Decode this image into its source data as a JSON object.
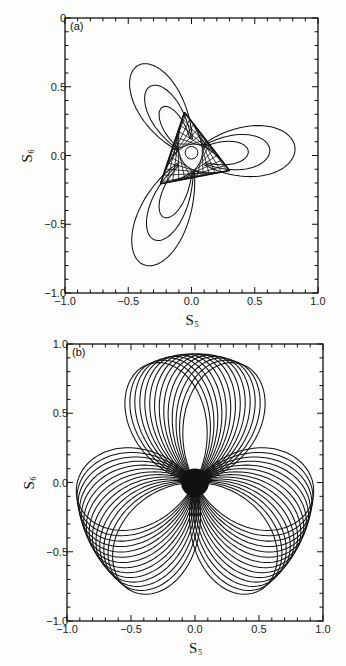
{
  "figure": {
    "background": "#fdfdfb",
    "line_color": "#111111"
  },
  "chart_data": [
    {
      "type": "line",
      "panel_label": "(a)",
      "title": "",
      "xlabel": "S5",
      "xlabel_main": "S",
      "xlabel_sub": "5",
      "ylabel": "S6",
      "ylabel_main": "S",
      "ylabel_sub": "6",
      "xlim": [
        -1.0,
        1.0
      ],
      "ylim": [
        -1.0,
        1.0
      ],
      "x_ticks": [
        "-1.0",
        "-0.5",
        "0.0",
        "0.5",
        "1.0"
      ],
      "y_ticks": [
        "-1.0",
        "-0.5",
        "0.0",
        "0.5",
        "0"
      ],
      "y_tick_values": [
        -1.0,
        -0.5,
        0.0,
        0.5,
        1.0
      ],
      "x_tick_values": [
        -1.0,
        -0.5,
        0.0,
        0.5,
        1.0
      ],
      "minor_tick_step": 0.1,
      "grid": false,
      "legend": null,
      "description": "Phase-space trajectory with three-fold symmetry: dense triangular web near origin with a small hole, plus three nested loop lobes extending to approx (-0.4,0.7), (0.8,0.0), (-0.45,-0.8)",
      "lobes": [
        {
          "direction_deg": 118,
          "loop_extents": [
            0.78,
            0.6,
            0.42
          ]
        },
        {
          "direction_deg": -2,
          "loop_extents": [
            0.82,
            0.62,
            0.45
          ]
        },
        {
          "direction_deg": 238,
          "loop_extents": [
            0.88,
            0.68,
            0.5
          ]
        }
      ],
      "web": {
        "radius": 0.32,
        "hole_radius": 0.05,
        "strands": 34
      },
      "frame_px": {
        "left": 65,
        "top": 18,
        "right": 318,
        "bottom": 293
      }
    },
    {
      "type": "line",
      "panel_label": "(b)",
      "title": "",
      "xlabel": "S5",
      "xlabel_main": "S",
      "xlabel_sub": "5",
      "ylabel": "S6",
      "ylabel_main": "S",
      "ylabel_sub": "6",
      "xlim": [
        -1.0,
        1.0
      ],
      "ylim": [
        -1.0,
        1.0
      ],
      "x_ticks": [
        "-1.0",
        "-0.5",
        "0.0",
        "0.5",
        "1.0"
      ],
      "y_ticks": [
        "-1.0",
        "-0.5",
        "0.0",
        "0.5",
        "1.0"
      ],
      "y_tick_values": [
        -1.0,
        -0.5,
        0.0,
        0.5,
        1.0
      ],
      "x_tick_values": [
        -1.0,
        -0.5,
        0.0,
        0.5,
        1.0
      ],
      "minor_tick_step": 0.1,
      "grid": false,
      "legend": null,
      "description": "Three-lobed rosette (trefoil) of petal loops passing through origin; each lobe composed of ~14 rotated elongated loops reaching radius ~0.93; dense black center",
      "lobes": [
        {
          "direction_deg": 90,
          "petals": 14,
          "spread_deg": 50,
          "length": 0.93
        },
        {
          "direction_deg": 210,
          "petals": 14,
          "spread_deg": 50,
          "length": 0.93
        },
        {
          "direction_deg": 330,
          "petals": 14,
          "spread_deg": 50,
          "length": 0.93
        }
      ],
      "frame_px": {
        "left": 67,
        "top": 344,
        "right": 323,
        "bottom": 621
      }
    }
  ]
}
